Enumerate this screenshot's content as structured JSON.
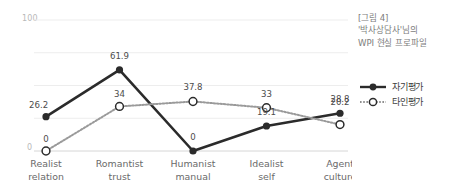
{
  "chart_data": {
    "type": "line",
    "title": "",
    "xlabel": "",
    "ylabel": "",
    "ylim": [
      0,
      100
    ],
    "grid": true,
    "legend_position": "right",
    "categories": [
      "Realist relation",
      "Romantist trust",
      "Humanist manual",
      "Idealist self",
      "Agent culture"
    ],
    "category_lines": [
      [
        "Realist",
        "relation"
      ],
      [
        "Romantist",
        "trust"
      ],
      [
        "Humanist",
        "manual"
      ],
      [
        "Idealist",
        "self"
      ],
      [
        "Agent",
        "culture"
      ]
    ],
    "y_ticks": [
      "0",
      "100"
    ],
    "series": [
      {
        "name": "자기평가",
        "style": "solid",
        "marker": "filled-circle",
        "color": "#2b2b2b",
        "values": [
          26.2,
          61.9,
          0,
          19.1,
          28.8
        ],
        "labels": [
          "26.2",
          "61.9",
          "0",
          "19.1",
          "28.8"
        ]
      },
      {
        "name": "타인평가",
        "style": "dotted",
        "marker": "open-circle",
        "color": "#9a9a9a",
        "values": [
          0,
          34,
          37.8,
          33,
          20.2
        ],
        "labels": [
          "0",
          "34",
          "37.8",
          "33",
          "20.2"
        ]
      }
    ]
  },
  "axis": {
    "y_max_label": "100",
    "y_min_label": "0"
  },
  "legend": {
    "items": [
      {
        "label": "자기평가",
        "style": "solid",
        "marker": "filled-circle"
      },
      {
        "label": "타인평가",
        "style": "dotted",
        "marker": "open-circle"
      }
    ]
  },
  "caption": {
    "line1": "[그림 4]",
    "line2": "'박사상담사'님의",
    "line3": "WPI 현실 프로파일"
  },
  "colors": {
    "self_series": "#2b2b2b",
    "other_series": "#9a9a9a",
    "grid": "#ededed",
    "axis_text": "#b9b9b9",
    "tick_text": "#6a6a6a",
    "caption_text": "#7d7d7d"
  }
}
